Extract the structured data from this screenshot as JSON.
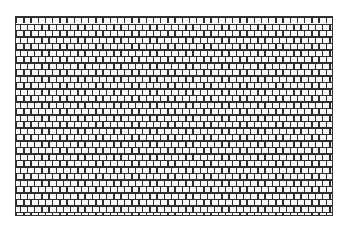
{
  "caption": {
    "text": "",
    "clipped": true
  },
  "pattern": {
    "name": "brick-texture",
    "type": "running-bond brick pattern",
    "line_color": "#2e2e2e",
    "fill_color": "#f7f7f7",
    "brick_width_px": 7.2,
    "row_height_px": 6.5
  }
}
